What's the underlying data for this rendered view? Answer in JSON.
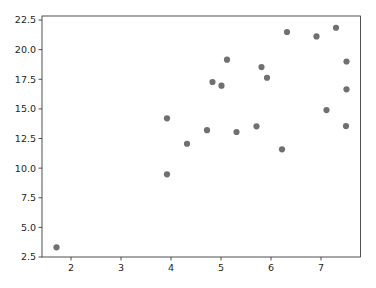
{
  "chart_data": {
    "type": "scatter",
    "title": "",
    "xlabel": "",
    "ylabel": "",
    "xlim": [
      1.42,
      7.79
    ],
    "ylim": [
      2.5,
      22.84
    ],
    "x_ticks": [
      2,
      3,
      4,
      5,
      6,
      7
    ],
    "x_tick_labels": [
      "2",
      "3",
      "4",
      "5",
      "6",
      "7"
    ],
    "y_ticks": [
      2.5,
      5.0,
      7.5,
      10.0,
      12.5,
      15.0,
      17.5,
      20.0,
      22.5
    ],
    "y_tick_labels": [
      "2.5",
      "5.0",
      "7.5",
      "10.0",
      "12.5",
      "15.0",
      "17.5",
      "20.0",
      "22.5"
    ],
    "grid": false,
    "legend": null,
    "marker_color": "#707070",
    "series": [
      {
        "name": "points",
        "points": [
          {
            "x": 1.71,
            "y": 3.32
          },
          {
            "x": 3.92,
            "y": 14.2
          },
          {
            "x": 3.92,
            "y": 9.48
          },
          {
            "x": 4.32,
            "y": 12.06
          },
          {
            "x": 4.72,
            "y": 13.2
          },
          {
            "x": 4.83,
            "y": 17.27
          },
          {
            "x": 5.01,
            "y": 16.96
          },
          {
            "x": 5.12,
            "y": 19.15
          },
          {
            "x": 5.31,
            "y": 13.05
          },
          {
            "x": 5.71,
            "y": 13.53
          },
          {
            "x": 5.81,
            "y": 18.53
          },
          {
            "x": 5.92,
            "y": 17.63
          },
          {
            "x": 6.22,
            "y": 11.59
          },
          {
            "x": 6.32,
            "y": 21.49
          },
          {
            "x": 6.91,
            "y": 21.12
          },
          {
            "x": 7.11,
            "y": 14.9
          },
          {
            "x": 7.3,
            "y": 21.85
          },
          {
            "x": 7.51,
            "y": 19.0
          },
          {
            "x": 7.51,
            "y": 16.65
          },
          {
            "x": 7.5,
            "y": 13.55
          }
        ]
      }
    ]
  },
  "plot_box": {
    "left": 42,
    "top": 16,
    "right": 360.5,
    "bottom": 257
  }
}
